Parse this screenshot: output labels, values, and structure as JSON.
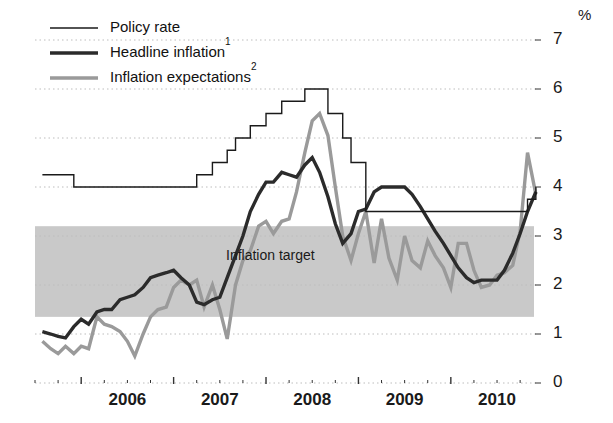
{
  "chart_data": {
    "type": "line",
    "title": "",
    "xlabel": "",
    "ylabel": "",
    "unit_label": "%",
    "ylim": [
      0,
      7
    ],
    "yticks": [
      0,
      1,
      2,
      3,
      4,
      5,
      6,
      7
    ],
    "ytick_labels": [
      "0",
      "1",
      "2",
      "3",
      "4",
      "5",
      "6",
      "7"
    ],
    "xlim": [
      2005.5,
      2010.9
    ],
    "xticks": [
      2006,
      2007,
      2008,
      2009,
      2010
    ],
    "xtick_labels": [
      "2006",
      "2007",
      "2008",
      "2009",
      "2010"
    ],
    "minor_xticks_per_year": 4,
    "grid": "horizontal-dotted",
    "legend_position": "top-left",
    "bands": [
      {
        "name": "Inflation target",
        "label": "Inflation target",
        "y_low": 1.35,
        "y_high": 3.2,
        "color": "#c9c9c9"
      }
    ],
    "series": [
      {
        "name": "Policy rate",
        "label": "Policy rate",
        "style": "step",
        "color": "#1a1a1a",
        "width": 1.4,
        "x": [
          2005.58,
          2005.75,
          2005.92,
          2007.08,
          2007.25,
          2007.42,
          2007.58,
          2007.67,
          2007.83,
          2008.0,
          2008.17,
          2008.42,
          2008.58,
          2008.67,
          2008.83,
          2008.92,
          2009.08,
          2010.67,
          2010.83,
          2010.92
        ],
        "values": [
          4.25,
          4.25,
          4.0,
          4.0,
          4.25,
          4.5,
          4.75,
          5.0,
          5.25,
          5.5,
          5.75,
          6.0,
          6.0,
          5.5,
          5.0,
          4.5,
          3.5,
          3.5,
          3.75,
          4.0
        ]
      },
      {
        "name": "Headline inflation",
        "label": "Headline inflation",
        "footnote": "1",
        "style": "line",
        "color": "#2b2b2b",
        "width": 3.4,
        "x": [
          2005.58,
          2005.67,
          2005.75,
          2005.83,
          2005.92,
          2006.0,
          2006.08,
          2006.17,
          2006.25,
          2006.33,
          2006.42,
          2006.5,
          2006.58,
          2006.67,
          2006.75,
          2006.83,
          2006.92,
          2007.0,
          2007.08,
          2007.17,
          2007.25,
          2007.33,
          2007.42,
          2007.5,
          2007.58,
          2007.67,
          2007.75,
          2007.83,
          2007.92,
          2008.0,
          2008.08,
          2008.17,
          2008.25,
          2008.33,
          2008.42,
          2008.5,
          2008.58,
          2008.67,
          2008.75,
          2008.83,
          2008.92,
          2009.0,
          2009.08,
          2009.17,
          2009.25,
          2009.33,
          2009.42,
          2009.5,
          2009.58,
          2009.67,
          2009.75,
          2009.83,
          2009.92,
          2010.0,
          2010.08,
          2010.17,
          2010.25,
          2010.33,
          2010.42,
          2010.5,
          2010.58,
          2010.67,
          2010.75,
          2010.83,
          2010.92
        ],
        "values": [
          1.05,
          1.0,
          0.95,
          0.92,
          1.15,
          1.3,
          1.2,
          1.45,
          1.5,
          1.5,
          1.7,
          1.75,
          1.8,
          1.95,
          2.15,
          2.2,
          2.25,
          2.3,
          2.15,
          2.0,
          1.65,
          1.6,
          1.7,
          1.75,
          2.15,
          2.6,
          3.0,
          3.5,
          3.85,
          4.1,
          4.1,
          4.3,
          4.25,
          4.2,
          4.45,
          4.6,
          4.3,
          3.8,
          3.25,
          2.85,
          3.05,
          3.5,
          3.55,
          3.9,
          4.0,
          4.0,
          4.0,
          4.0,
          3.85,
          3.6,
          3.35,
          3.1,
          2.85,
          2.6,
          2.35,
          2.15,
          2.05,
          2.1,
          2.1,
          2.1,
          2.3,
          2.65,
          3.05,
          3.5,
          3.9
        ]
      },
      {
        "name": "Inflation expectations",
        "label": "Inflation expectations",
        "footnote": "2",
        "style": "line",
        "color": "#9a9a9a",
        "width": 3.4,
        "x": [
          2005.58,
          2005.67,
          2005.75,
          2005.83,
          2005.92,
          2006.0,
          2006.08,
          2006.17,
          2006.25,
          2006.33,
          2006.42,
          2006.5,
          2006.58,
          2006.67,
          2006.75,
          2006.83,
          2006.92,
          2007.0,
          2007.08,
          2007.17,
          2007.25,
          2007.33,
          2007.42,
          2007.5,
          2007.58,
          2007.67,
          2007.75,
          2007.83,
          2007.92,
          2008.0,
          2008.08,
          2008.17,
          2008.25,
          2008.33,
          2008.42,
          2008.5,
          2008.58,
          2008.67,
          2008.75,
          2008.83,
          2008.92,
          2009.0,
          2009.08,
          2009.17,
          2009.25,
          2009.33,
          2009.42,
          2009.5,
          2009.58,
          2009.67,
          2009.75,
          2009.83,
          2009.92,
          2010.0,
          2010.08,
          2010.17,
          2010.25,
          2010.33,
          2010.42,
          2010.5,
          2010.58,
          2010.67,
          2010.75,
          2010.83,
          2010.92
        ],
        "values": [
          0.85,
          0.7,
          0.6,
          0.75,
          0.6,
          0.75,
          0.7,
          1.35,
          1.2,
          1.15,
          1.05,
          0.85,
          0.55,
          1.0,
          1.35,
          1.5,
          1.55,
          1.95,
          2.1,
          2.0,
          2.1,
          1.55,
          2.0,
          1.5,
          0.9,
          2.0,
          2.5,
          2.7,
          3.2,
          3.3,
          3.05,
          3.3,
          3.35,
          3.9,
          4.7,
          5.35,
          5.5,
          5.05,
          4.0,
          3.0,
          2.5,
          3.05,
          3.5,
          2.45,
          3.35,
          2.55,
          2.1,
          3.0,
          2.5,
          2.35,
          2.9,
          2.6,
          2.35,
          1.95,
          2.85,
          2.85,
          2.3,
          1.95,
          2.0,
          2.2,
          2.25,
          2.4,
          3.1,
          4.7,
          3.85
        ]
      }
    ]
  },
  "legend": {
    "items": [
      {
        "label": "Policy rate",
        "footnote": "",
        "swatch": "thin-black-line"
      },
      {
        "label": "Headline inflation",
        "footnote": "1",
        "swatch": "thick-black-line"
      },
      {
        "label": "Inflation expectations",
        "footnote": "2",
        "swatch": "thick-gray-line"
      }
    ]
  },
  "colors": {
    "policy_rate": "#1a1a1a",
    "headline_inflation": "#2b2b2b",
    "inflation_expectations": "#9a9a9a",
    "target_band": "#c9c9c9",
    "gridline": "#bdbdbd",
    "axis": "#333333",
    "background": "#ffffff"
  }
}
